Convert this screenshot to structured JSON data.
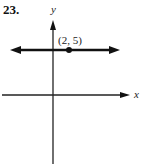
{
  "problem_number": "23.",
  "axes": {
    "x_label": "x",
    "y_label": "y"
  },
  "point": {
    "label": "(2, 5)",
    "x": 2,
    "y": 5
  },
  "line": {
    "type": "horizontal",
    "equation": "y = 5",
    "arrows": "both"
  },
  "colors": {
    "ink": "#111111",
    "background": "#ffffff"
  }
}
